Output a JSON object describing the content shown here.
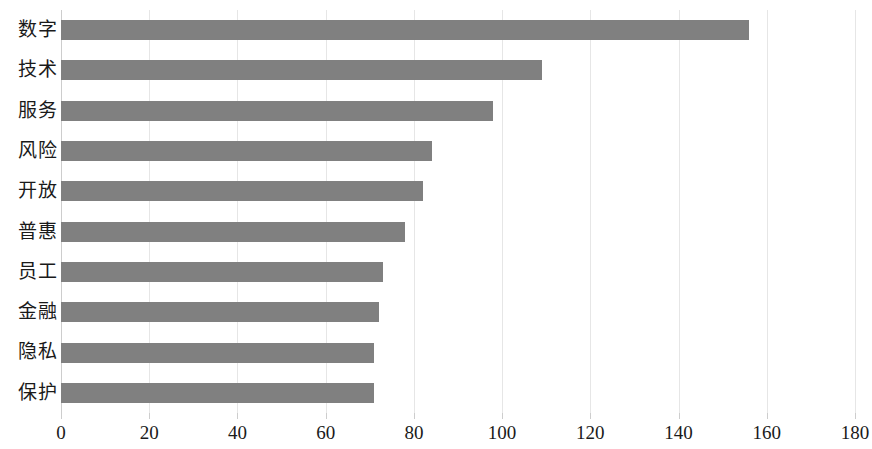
{
  "chart_data": {
    "type": "bar",
    "orientation": "horizontal",
    "title": "",
    "subtitle": "",
    "xlabel": "",
    "ylabel": "",
    "categories": [
      "数字",
      "技术",
      "服务",
      "风险",
      "开放",
      "普惠",
      "员工",
      "金融",
      "隐私",
      "保护"
    ],
    "values": [
      156,
      109,
      98,
      84,
      82,
      78,
      73,
      72,
      71,
      71
    ],
    "series": [
      {
        "name": "",
        "values": [
          156,
          109,
          98,
          84,
          82,
          78,
          73,
          72,
          71,
          71
        ]
      }
    ],
    "xlim": [
      0,
      180
    ],
    "xticks": [
      0,
      20,
      40,
      60,
      80,
      100,
      120,
      140,
      160,
      180
    ],
    "xtick_labels": [
      "0",
      "20",
      "40",
      "60",
      "80",
      "100",
      "120",
      "140",
      "160",
      "180"
    ],
    "grid": "vertical",
    "legend": "none",
    "bar_color": "#808080",
    "gridline_color": "#e6e6e6",
    "axis_color": "#cdcdcd",
    "background_color": "#ffffff",
    "text_color": "#1a1a1a"
  }
}
